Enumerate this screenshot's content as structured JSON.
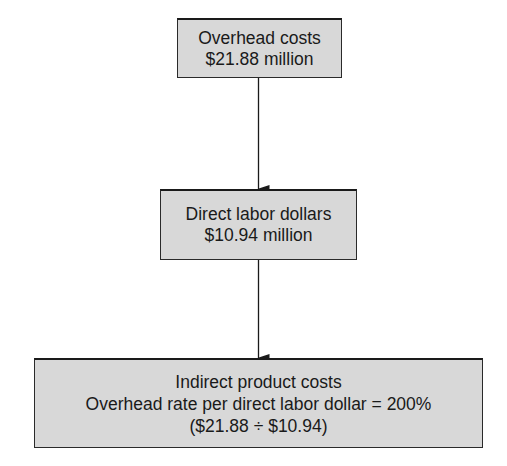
{
  "diagram": {
    "nodes": [
      {
        "id": "overhead-costs",
        "lines": [
          "Overhead costs",
          "$21.88 million"
        ]
      },
      {
        "id": "direct-labor-dollars",
        "lines": [
          "Direct labor dollars",
          "$10.94 million"
        ]
      },
      {
        "id": "indirect-product-costs",
        "lines": [
          "Indirect product costs",
          "Overhead rate per direct labor dollar = 200%",
          "($21.88 ÷ $10.94)"
        ]
      }
    ],
    "edges": [
      {
        "from": "overhead-costs",
        "to": "direct-labor-dollars"
      },
      {
        "from": "direct-labor-dollars",
        "to": "indirect-product-costs"
      }
    ],
    "colors": {
      "box_fill": "#d8d8d8",
      "border": "#1a1a1a",
      "arrow": "#1a1a1a"
    }
  }
}
